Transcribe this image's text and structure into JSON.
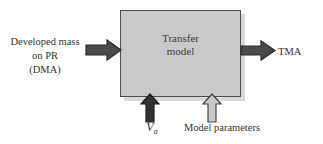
{
  "diagram": {
    "background_color": "#ffffff",
    "process_box": {
      "name": "transfer-model",
      "label_line1": "Transfer",
      "label_line2": "model",
      "fill_color": "#c9c9c9",
      "border_color": "#4e4e4e",
      "shadow_color": "#b9b9b9"
    },
    "input": {
      "label_line1": "Developed mass",
      "label_line2": "on PR",
      "label_line3": "(DMA)",
      "arrow_direction": "right",
      "arrow_color": "#4a4a4a",
      "arrow_outline": "#2e2e2e"
    },
    "output": {
      "label": "TMA",
      "arrow_direction": "right",
      "arrow_color": "#4a4a4a",
      "arrow_outline": "#2e2e2e"
    },
    "bottom_inputs": [
      {
        "name": "va",
        "label_main": "V",
        "label_sub": "a",
        "arrow_direction": "up",
        "arrow_color": "#333333",
        "arrow_outline": "#1f1f1f"
      },
      {
        "name": "model-parameters",
        "label": "Model parameters",
        "arrow_direction": "up",
        "arrow_color": "#c9c9c9",
        "arrow_outline": "#444444"
      }
    ]
  }
}
